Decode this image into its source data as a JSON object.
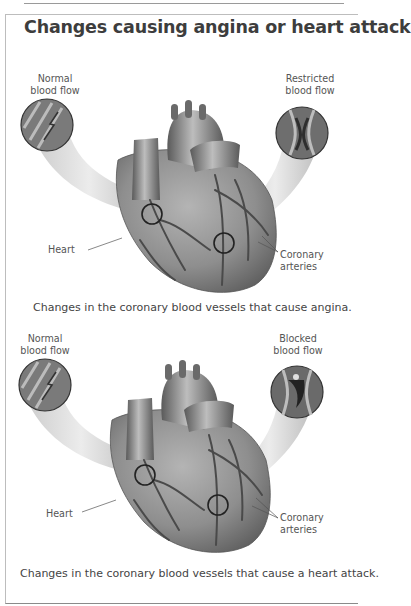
{
  "title": "Changes causing angina or heart attack",
  "panels": [
    {
      "left_inset": {
        "line1": "Normal",
        "line2": "blood flow"
      },
      "right_inset": {
        "line1": "Restricted",
        "line2": "blood flow"
      },
      "heart_label": "Heart",
      "arteries_label": {
        "line1": "Coronary",
        "line2": "arteries"
      },
      "caption": "Changes in the coronary blood vessels that cause angina."
    },
    {
      "left_inset": {
        "line1": "Normal",
        "line2": "blood flow"
      },
      "right_inset": {
        "line1": "Blocked",
        "line2": "blood flow"
      },
      "heart_label": "Heart",
      "arteries_label": {
        "line1": "Coronary",
        "line2": "arteries"
      },
      "caption": "Changes in the coronary blood vessels that cause a heart attack."
    }
  ],
  "colors": {
    "heart_fill": "#8c8c8c",
    "artery_stroke": "#4a4a4a",
    "tube_fill": "#d6d6d6",
    "text": "#444444"
  }
}
